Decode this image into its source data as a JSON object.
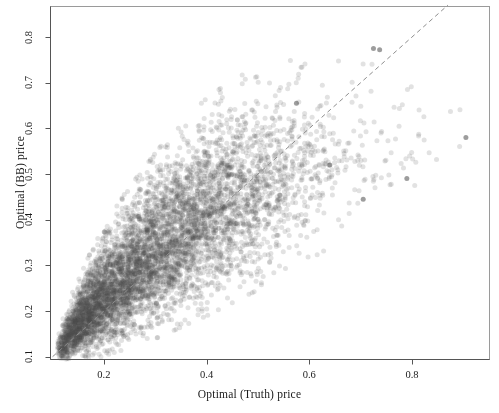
{
  "chart_data": {
    "type": "scatter",
    "title": "",
    "xlabel": "Optimal (Truth) price",
    "ylabel": "Optimal (BB) price",
    "xlim": [
      0.095,
      0.95
    ],
    "ylim": [
      0.095,
      0.868
    ],
    "xticks": [
      0.2,
      0.4,
      0.6,
      0.8
    ],
    "xtick_labels": [
      "0.2",
      "0.4",
      "0.6",
      "0.8"
    ],
    "yticks": [
      0.1,
      0.2,
      0.3,
      0.4,
      0.5,
      0.6,
      0.7,
      0.8
    ],
    "ytick_labels": [
      "0.1",
      "0.2",
      "0.3",
      "0.4",
      "0.5",
      "0.6",
      "0.7",
      "0.8"
    ],
    "grid": false,
    "legend": null,
    "marker": {
      "shape": "circle",
      "color": "#4d4d4d",
      "alpha": 0.16,
      "radius_px": 2.5,
      "count": 6000
    },
    "reference_line": {
      "kind": "identity",
      "label": "y = x",
      "style": "dashed",
      "color": "#8c8c8c",
      "x_start": 0.1,
      "y_start": 0.1,
      "x_end": 0.87,
      "y_end": 0.87
    },
    "series": [
      {
        "name": "Optimal price pairs",
        "n_points": 6000,
        "x_mean": 0.33,
        "y_mean": 0.345,
        "correlation": 0.9,
        "points_note": "Individual point coordinates are generated from the fitted envelope described below rather than enumerated.",
        "envelope": [
          {
            "x": 0.11,
            "y_center": 0.115,
            "y_spread": 0.012,
            "density": 0.3
          },
          {
            "x": 0.14,
            "y_center": 0.158,
            "y_spread": 0.028,
            "density": 0.85
          },
          {
            "x": 0.17,
            "y_center": 0.196,
            "y_spread": 0.04,
            "density": 1.0
          },
          {
            "x": 0.2,
            "y_center": 0.232,
            "y_spread": 0.05,
            "density": 0.98
          },
          {
            "x": 0.24,
            "y_center": 0.272,
            "y_spread": 0.06,
            "density": 0.92
          },
          {
            "x": 0.28,
            "y_center": 0.308,
            "y_spread": 0.068,
            "density": 0.84
          },
          {
            "x": 0.32,
            "y_center": 0.344,
            "y_spread": 0.075,
            "density": 0.76
          },
          {
            "x": 0.36,
            "y_center": 0.378,
            "y_spread": 0.08,
            "density": 0.66
          },
          {
            "x": 0.4,
            "y_center": 0.408,
            "y_spread": 0.084,
            "density": 0.56
          },
          {
            "x": 0.45,
            "y_center": 0.442,
            "y_spread": 0.086,
            "density": 0.44
          },
          {
            "x": 0.5,
            "y_center": 0.47,
            "y_spread": 0.086,
            "density": 0.31
          },
          {
            "x": 0.55,
            "y_center": 0.495,
            "y_spread": 0.082,
            "density": 0.18
          },
          {
            "x": 0.6,
            "y_center": 0.516,
            "y_spread": 0.078,
            "density": 0.1
          },
          {
            "x": 0.66,
            "y_center": 0.54,
            "y_spread": 0.072,
            "density": 0.05
          },
          {
            "x": 0.72,
            "y_center": 0.562,
            "y_spread": 0.068,
            "density": 0.025
          },
          {
            "x": 0.8,
            "y_center": 0.59,
            "y_spread": 0.062,
            "density": 0.012
          },
          {
            "x": 0.9,
            "y_center": 0.62,
            "y_spread": 0.055,
            "density": 0.005
          }
        ],
        "notable_outliers": [
          {
            "x": 0.725,
            "y": 0.775
          },
          {
            "x": 0.737,
            "y": 0.772
          },
          {
            "x": 0.575,
            "y": 0.655
          },
          {
            "x": 0.705,
            "y": 0.445
          },
          {
            "x": 0.64,
            "y": 0.52
          },
          {
            "x": 0.79,
            "y": 0.49
          },
          {
            "x": 0.905,
            "y": 0.58
          }
        ]
      }
    ]
  },
  "figure": {
    "background_color": "#ffffff",
    "plot_border_color": "#9a9a9a",
    "axis_color": "#555555",
    "text_color": "#1a1a1a",
    "plot_box": {
      "left": 50,
      "top": 6,
      "right": 489,
      "bottom": 359
    }
  }
}
